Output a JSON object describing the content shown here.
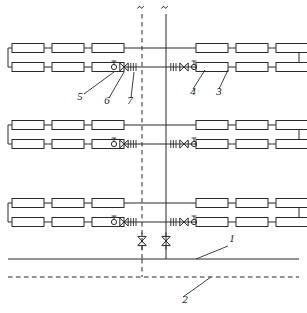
{
  "diagram": {
    "type": "piping-schematic",
    "canvas": {
      "width": 307,
      "height": 313
    },
    "labels": [
      {
        "id": "1",
        "text": "1",
        "x": 232,
        "y": 242,
        "leader_from": [
          228,
          246
        ],
        "leader_to": [
          196,
          259
        ],
        "refers_to": "supply-main-solid"
      },
      {
        "id": "2",
        "text": "2",
        "x": 185,
        "y": 303,
        "leader_from": [
          183,
          297
        ],
        "leader_to": [
          211,
          277
        ],
        "refers_to": "return-main-dashed"
      },
      {
        "id": "3",
        "text": "3",
        "x": 219,
        "y": 95,
        "leader_from": [
          219,
          89
        ],
        "leader_to": [
          228,
          70
        ],
        "refers_to": "radiator"
      },
      {
        "id": "4",
        "text": "4",
        "x": 193,
        "y": 95,
        "leader_from": [
          193,
          89
        ],
        "leader_to": [
          205,
          70
        ],
        "refers_to": "radiator-branch"
      },
      {
        "id": "5",
        "text": "5",
        "x": 80,
        "y": 100,
        "leader_from": [
          84,
          94
        ],
        "leader_to": [
          114,
          72
        ],
        "refers_to": "balancing-valve"
      },
      {
        "id": "6",
        "text": "6",
        "x": 107,
        "y": 104,
        "leader_from": [
          109,
          98
        ],
        "leader_to": [
          124,
          72
        ],
        "refers_to": "shutoff-valve"
      },
      {
        "id": "7",
        "text": "7",
        "x": 130,
        "y": 104,
        "leader_from": [
          131,
          98
        ],
        "leader_to": [
          134,
          72
        ],
        "refers_to": "flexible-connector"
      }
    ],
    "risers": [
      {
        "name": "return-riser",
        "x": 142,
        "style": "dashed",
        "top_break": true
      },
      {
        "name": "supply-riser",
        "x": 166,
        "style": "solid",
        "top_break": true
      }
    ],
    "floors": [
      {
        "name": "floor-level-3",
        "upper_y": 48,
        "lower_y": 67
      },
      {
        "name": "floor-level-2",
        "upper_y": 125,
        "lower_y": 144
      },
      {
        "name": "floor-level-1",
        "upper_y": 203,
        "lower_y": 222
      }
    ],
    "radiator_x_left": [
      12,
      52,
      92
    ],
    "radiator_x_right": [
      196,
      236,
      276
    ],
    "radiator_size": {
      "width": 32,
      "height": 9
    },
    "mains": [
      {
        "name": "supply-main",
        "y": 259,
        "style": "solid",
        "label": "1"
      },
      {
        "name": "return-main",
        "y": 277,
        "style": "dashed",
        "label": "2"
      }
    ],
    "riser_valves": [
      {
        "name": "return-riser-gate-valve",
        "x": 142,
        "y": 241
      },
      {
        "name": "supply-riser-gate-valve",
        "x": 166,
        "y": 241
      }
    ],
    "branch_symbols_left": [
      {
        "name": "balancing-valve",
        "kind": "circle-stem",
        "x": 114,
        "label": "5"
      },
      {
        "name": "shutoff-valve",
        "kind": "bowtie",
        "x": 124,
        "label": "6"
      },
      {
        "name": "flexible-connector",
        "kind": "flex-coupling",
        "x": 134,
        "label": "7"
      }
    ],
    "branch_symbols_right": [
      {
        "name": "flexible-connector",
        "kind": "flex-coupling",
        "x": 174
      },
      {
        "name": "shutoff-valve",
        "kind": "bowtie",
        "x": 184
      },
      {
        "name": "balancing-valve",
        "kind": "circle-stem",
        "x": 194
      }
    ],
    "colors": {
      "line": "#2a2a2a",
      "background": "#ffffff",
      "label_text": "#1a1a1a"
    }
  }
}
